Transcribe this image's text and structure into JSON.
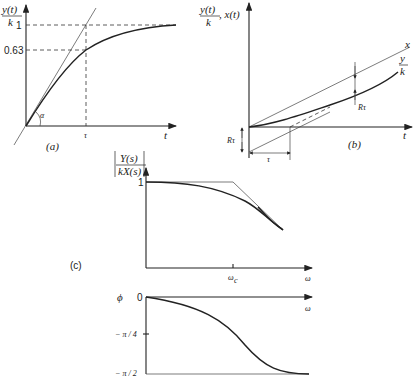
{
  "figure": {
    "panel_a": {
      "label": "(a)",
      "y_label_num": "y(t)",
      "y_label_den": "k",
      "x_label": "t",
      "ticks_y": [
        "1",
        "0.63"
      ],
      "tick_x": "τ",
      "angle_label": "α"
    },
    "panel_b": {
      "label": "(b)",
      "y_label_num": "y(t)",
      "y_label_den": "k",
      "y_label_extra": ", x(t)",
      "x_label": "t",
      "line_x_label": "x",
      "line_y_num": "y",
      "line_y_den": "k",
      "r_tau_right": "Rτ",
      "r_tau_left": "Rτ",
      "tau_label": "τ"
    },
    "panel_c": {
      "label": "(c)",
      "magnitude": {
        "y_label_num": "Y(s)",
        "y_label_den": "kX(s)",
        "tick_y": "1",
        "tick_x": "ω_c",
        "tick_x_main": "ω",
        "tick_x_sub": "c",
        "x_label": "ω"
      },
      "phase": {
        "y_label": "ϕ",
        "ticks_y": [
          "0",
          "− π / 4",
          "− π / 2"
        ],
        "x_label": "ω"
      }
    }
  }
}
